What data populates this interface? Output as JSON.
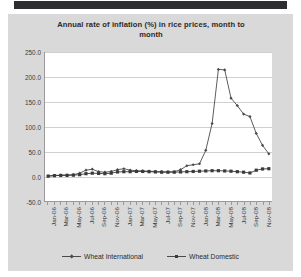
{
  "chart_data": {
    "type": "line",
    "title": "Annual rate of inflation (%)  in rice prices, month to month",
    "title_line1": "Annual rate of inflation (%)  in rice prices, month to",
    "title_line2": "month",
    "xlabel": "",
    "ylabel": "",
    "ylim": [
      -50.0,
      250.0
    ],
    "ytick_labels": [
      "250.0",
      "200.0",
      "150.0",
      "100.0",
      "50.0",
      "0.0",
      "-50.0"
    ],
    "ytick_values": [
      250.0,
      200.0,
      150.0,
      100.0,
      50.0,
      0.0,
      -50.0
    ],
    "grid": true,
    "legend_position": "bottom",
    "x": [
      "Jan-06",
      "Feb-06",
      "Mar-06",
      "Apr-06",
      "May-06",
      "Jun-06",
      "Jul-06",
      "Aug-06",
      "Sep-06",
      "Oct-06",
      "Nov-06",
      "Dec-06",
      "Jan-07",
      "Feb-07",
      "Mar-07",
      "Apr-07",
      "May-07",
      "Jun-07",
      "Jul-07",
      "Aug-07",
      "Sep-07",
      "Oct-07",
      "Nov-07",
      "Dec-07",
      "Jan-08",
      "Feb-08",
      "Mar-08",
      "Apr-08",
      "May-08",
      "Jun-08",
      "Jul-08",
      "Aug-08",
      "Sep-08",
      "Oct-08",
      "Nov-08",
      "Dec-08"
    ],
    "xtick_labels": [
      "Jan-06",
      "Mar-06",
      "May-06",
      "Jul-06",
      "Sep-06",
      "Nov-06",
      "Jan-07",
      "Mar-07",
      "May-07",
      "Jul-07",
      "Sep-07",
      "Nov-07",
      "Jan-08",
      "Mar-08",
      "May-08",
      "Jul-08",
      "Sep-08",
      "Nov-08"
    ],
    "xtick_every": 2,
    "series": [
      {
        "name": "Wheat International",
        "marker": "diamond",
        "color": "#4a4a4a",
        "values": [
          0.5,
          1.5,
          2.0,
          2.5,
          3.0,
          6.0,
          12.0,
          14.0,
          9.0,
          8.0,
          9.5,
          13.0,
          15.0,
          12.0,
          11.0,
          10.5,
          10.0,
          9.5,
          9.0,
          8.5,
          9.0,
          13.0,
          21.0,
          23.0,
          25.0,
          52.0,
          106.0,
          215.0,
          214.0,
          157.0,
          142.0,
          125.0,
          120.0,
          86.0,
          62.0,
          45.0
        ]
      },
      {
        "name": "Wheat Domestic",
        "marker": "square",
        "color": "#3a3a3a",
        "values": [
          0.0,
          1.0,
          1.5,
          1.5,
          2.0,
          3.0,
          5.0,
          6.0,
          5.5,
          5.0,
          6.0,
          8.5,
          9.0,
          9.0,
          9.5,
          9.5,
          9.0,
          8.5,
          8.0,
          8.0,
          8.0,
          8.5,
          9.0,
          9.5,
          10.0,
          10.5,
          11.0,
          11.0,
          10.5,
          10.0,
          9.0,
          8.0,
          6.5,
          12.0,
          14.5,
          15.0
        ]
      }
    ]
  },
  "legend": {
    "items": [
      {
        "label": "Wheat International"
      },
      {
        "label": "Wheat Domestic"
      }
    ]
  }
}
